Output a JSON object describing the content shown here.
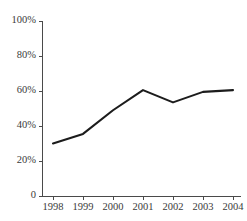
{
  "chart_data": {
    "type": "line",
    "title": "",
    "subtitle": "",
    "xlabel": "",
    "ylabel": "",
    "x": [
      "1998",
      "1999",
      "2000",
      "2001",
      "2002",
      "2003",
      "2004"
    ],
    "categories": [
      "1998",
      "1999",
      "2000",
      "2001",
      "2002",
      "2003",
      "2004"
    ],
    "values": [
      30,
      35.5,
      49,
      60.5,
      53.5,
      59.5,
      60.5
    ],
    "series": [
      {
        "name": "",
        "values": [
          30,
          35.5,
          49,
          60.5,
          53.5,
          59.5,
          60.5
        ]
      }
    ],
    "ylim": [
      0,
      100
    ],
    "yticks": [
      0,
      20,
      40,
      60,
      80,
      100
    ],
    "ytick_labels": [
      "0",
      "20%",
      "40%",
      "60%",
      "80%",
      "100%"
    ],
    "xtick_labels": [
      "1998",
      "1999",
      "2000",
      "2001",
      "2002",
      "2003",
      "2004"
    ],
    "grid": false,
    "legend": false,
    "legend_position": "none",
    "line_color": "#1c1c1c",
    "axis_color": "#4a4a4a",
    "background_color": "#ffffff"
  },
  "axes": {
    "y_labels": [
      {
        "text": "100%",
        "value": 100
      },
      {
        "text": "80%",
        "value": 80
      },
      {
        "text": "60%",
        "value": 60
      },
      {
        "text": "40%",
        "value": 40
      },
      {
        "text": "20%",
        "value": 20
      },
      {
        "text": "0",
        "value": 0
      }
    ],
    "x_labels": [
      {
        "text": "1998"
      },
      {
        "text": "1999"
      },
      {
        "text": "2000"
      },
      {
        "text": "2001"
      },
      {
        "text": "2002"
      },
      {
        "text": "2003"
      },
      {
        "text": "2004"
      }
    ]
  }
}
